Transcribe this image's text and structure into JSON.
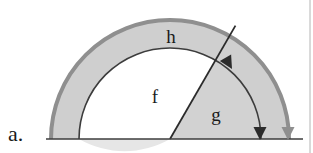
{
  "figure": {
    "caption_label": "a.",
    "background_color": "#ffffff",
    "border_color": "#b4b4b4",
    "baseline_color": "#3c3c3c",
    "outer_band_fill": "#cfcfcf",
    "inner_disc_fill": "#e6e6e6",
    "inner_sector_fill": "#d2d2d2",
    "outer_arc_color": "#8f8f8f",
    "inner_arc_color": "#3c3c3c",
    "ray_color": "#2b2b2b",
    "arrow_dark_color": "#2b2b2b",
    "arrow_gray_color": "#8f8f8f",
    "geometry": {
      "center_x": 170,
      "center_y": 139,
      "outer_radius": 119,
      "inner_radius": 91,
      "ray_angle_degrees": 60,
      "baseline_y": 139,
      "baseline_x_start": 46,
      "baseline_x_end": 303
    },
    "labels": [
      {
        "name": "angle-h",
        "text": "h",
        "x": 171,
        "y": 43
      },
      {
        "name": "angle-f",
        "text": "f",
        "x": 155,
        "y": 103
      },
      {
        "name": "angle-g",
        "text": "g",
        "x": 216,
        "y": 121
      },
      {
        "name": "item-letter",
        "text": "a.",
        "x": 8,
        "y": 141
      }
    ],
    "arrowheads": [
      {
        "name": "inner-arc-ray-arrowhead",
        "color": "#2b2b2b",
        "x": 228,
        "y": 62,
        "rotation": 150
      },
      {
        "name": "inner-arc-base-arrowhead",
        "color": "#2b2b2b",
        "x": 260,
        "y": 132,
        "rotation": 180
      },
      {
        "name": "outer-arc-base-arrowhead",
        "color": "#8f8f8f",
        "x": 288,
        "y": 132,
        "rotation": 180
      }
    ]
  }
}
